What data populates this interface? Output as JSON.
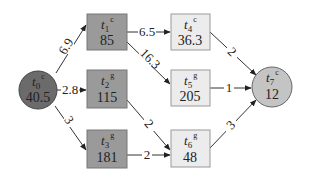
{
  "diagram": {
    "type": "task-graph",
    "colors": {
      "dark_node": "#6b6b6b",
      "medium_node": "#9a9a9a",
      "light_node": "#ececec",
      "sink_node": "#c4c4c4",
      "stroke": "#555555",
      "edge": "#333333"
    },
    "nodes": [
      {
        "id": "t0",
        "name": "t",
        "sub": "0",
        "sup": "c",
        "value": "40.5",
        "shape": "circle"
      },
      {
        "id": "t1",
        "name": "t",
        "sub": "1",
        "sup": "c",
        "value": "85",
        "shape": "box"
      },
      {
        "id": "t2",
        "name": "t",
        "sub": "2",
        "sup": "g",
        "value": "115",
        "shape": "box"
      },
      {
        "id": "t3",
        "name": "t",
        "sub": "3",
        "sup": "g",
        "value": "181",
        "shape": "box"
      },
      {
        "id": "t4",
        "name": "t",
        "sub": "4",
        "sup": "c",
        "value": "36.3",
        "shape": "box"
      },
      {
        "id": "t5",
        "name": "t",
        "sub": "5",
        "sup": "g",
        "value": "205",
        "shape": "box"
      },
      {
        "id": "t6",
        "name": "t",
        "sub": "6",
        "sup": "g",
        "value": "48",
        "shape": "box"
      },
      {
        "id": "t7",
        "name": "t",
        "sub": "7",
        "sup": "c",
        "value": "12",
        "shape": "circle"
      }
    ],
    "edges": [
      {
        "from": "t0",
        "to": "t1",
        "label": "6.9"
      },
      {
        "from": "t0",
        "to": "t2",
        "label": "2.8"
      },
      {
        "from": "t0",
        "to": "t3",
        "label": "3"
      },
      {
        "from": "t1",
        "to": "t4",
        "label": "6.5"
      },
      {
        "from": "t1",
        "to": "t5",
        "label": "16.3"
      },
      {
        "from": "t2",
        "to": "t6",
        "label": "2"
      },
      {
        "from": "t3",
        "to": "t6",
        "label": "2"
      },
      {
        "from": "t4",
        "to": "t7",
        "label": "2"
      },
      {
        "from": "t5",
        "to": "t7",
        "label": "1"
      },
      {
        "from": "t6",
        "to": "t7",
        "label": "3"
      }
    ]
  }
}
